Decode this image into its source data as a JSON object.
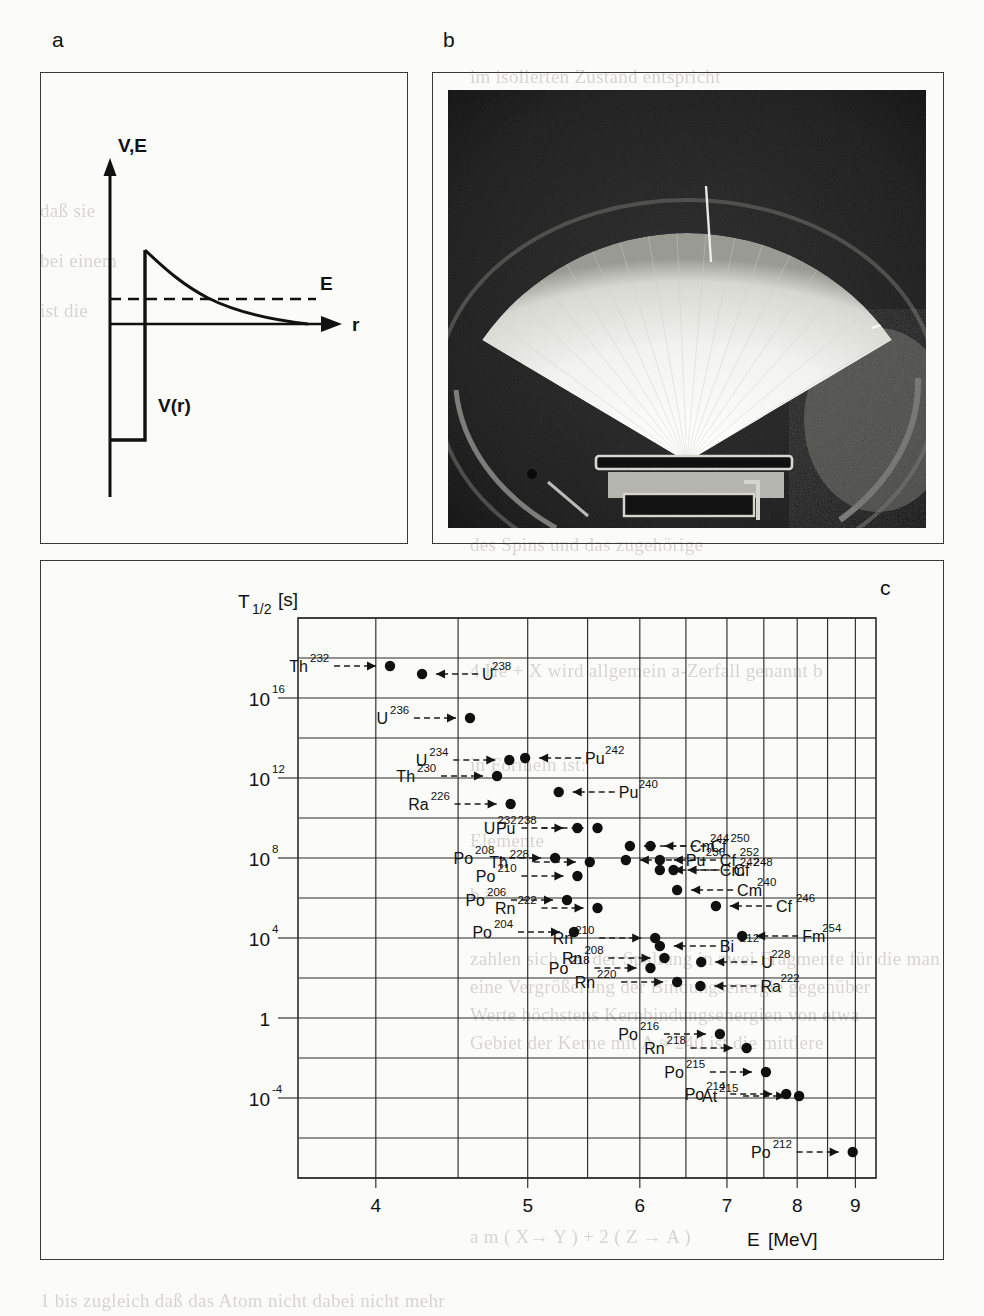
{
  "figure": {
    "panels": [
      {
        "id": "a",
        "letter": "a",
        "kind": "potential-barrier-diagram"
      },
      {
        "id": "b",
        "letter": "b",
        "kind": "cloud-chamber-photograph"
      },
      {
        "id": "c",
        "letter": "c",
        "kind": "geiger-nuttall-plot"
      }
    ]
  },
  "panel_a": {
    "letter": "a",
    "y_axis_label": "V,E",
    "x_axis_label": "r",
    "energy_level_label": "E",
    "potential_label": "V(r)"
  },
  "panel_b": {
    "letter": "b",
    "description": "cloud chamber photograph of alpha particle tracks forming a fan"
  },
  "panel_c": {
    "letter": "c"
  },
  "chart_data": {
    "type": "scatter",
    "title": "",
    "xlabel": "E  [MeV]",
    "ylabel": "T1/2  [s]",
    "ylabel_base": "T",
    "ylabel_sub": "1/2",
    "ylabel_unit": "[s]",
    "xlabel_sym": "E",
    "xlabel_unit": "[MeV]",
    "x_scale": "1/sqrt(E)",
    "y_scale": "log10",
    "xlim": [
      3.6,
      9.4
    ],
    "ylim_log": [
      -8,
      20
    ],
    "grid": true,
    "legend": "none",
    "xticks": [
      "4",
      "5",
      "6",
      "7",
      "8",
      "9"
    ],
    "xtick_values": [
      4,
      5,
      6,
      7,
      8,
      9
    ],
    "yticks": [
      "10¹⁶",
      "10¹²",
      "10⁸",
      "10⁴",
      "1",
      "10⁻⁴"
    ],
    "ytick_exponents": [
      16,
      12,
      8,
      4,
      0,
      -4
    ],
    "ytick_base": [
      "10",
      "10",
      "10",
      "10",
      "1",
      "10"
    ],
    "ytick_sup": [
      "16",
      "12",
      "8",
      "4",
      "",
      "-4"
    ],
    "points": [
      {
        "el": "Th",
        "a": "232",
        "E": 4.08,
        "logT": 17.6,
        "label_side": "left"
      },
      {
        "el": "U",
        "a": "238",
        "E": 4.27,
        "logT": 17.2,
        "label_side": "right"
      },
      {
        "el": "U",
        "a": "236",
        "E": 4.58,
        "logT": 15.0,
        "label_side": "left"
      },
      {
        "el": "U",
        "a": "234",
        "E": 4.86,
        "logT": 12.9,
        "label_side": "left"
      },
      {
        "el": "Pu",
        "a": "242",
        "E": 4.98,
        "logT": 13.0,
        "label_side": "right"
      },
      {
        "el": "Th",
        "a": "230",
        "E": 4.77,
        "logT": 12.1,
        "label_side": "left"
      },
      {
        "el": "Ra",
        "a": "226",
        "E": 4.87,
        "logT": 10.7,
        "label_side": "left"
      },
      {
        "el": "Pu",
        "a": "240",
        "E": 5.25,
        "logT": 11.3,
        "label_side": "right"
      },
      {
        "el": "U",
        "a": "232",
        "E": 5.41,
        "logT": 9.5,
        "label_side": "left"
      },
      {
        "el": "Pu",
        "a": "238",
        "E": 5.59,
        "logT": 9.5,
        "label_side": "left"
      },
      {
        "el": "Cf",
        "a": "252",
        "E": 6.21,
        "logT": 7.9,
        "label_side": "right"
      },
      {
        "el": "Cm",
        "a": "244",
        "E": 5.9,
        "logT": 8.6,
        "label_side": "right"
      },
      {
        "el": "Cf",
        "a": "250",
        "E": 6.11,
        "logT": 8.6,
        "label_side": "right"
      },
      {
        "el": "Cm",
        "a": "242",
        "E": 6.21,
        "logT": 7.4,
        "label_side": "right"
      },
      {
        "el": "Cf",
        "a": "248",
        "E": 6.36,
        "logT": 7.4,
        "label_side": "right"
      },
      {
        "el": "Po",
        "a": "208",
        "E": 5.22,
        "logT": 8.0,
        "label_side": "left"
      },
      {
        "el": "Po",
        "a": "210",
        "E": 5.41,
        "logT": 7.1,
        "label_side": "left"
      },
      {
        "el": "Th",
        "a": "228",
        "E": 5.52,
        "logT": 7.8,
        "label_side": "left"
      },
      {
        "el": "Pu",
        "a": "236",
        "E": 5.86,
        "logT": 7.9,
        "label_side": "right"
      },
      {
        "el": "Cm",
        "a": "240",
        "E": 6.4,
        "logT": 6.4,
        "label_side": "right"
      },
      {
        "el": "Po",
        "a": "206",
        "E": 5.32,
        "logT": 5.9,
        "label_side": "left"
      },
      {
        "el": "Rn",
        "a": "222",
        "E": 5.59,
        "logT": 5.5,
        "label_side": "left"
      },
      {
        "el": "Cf",
        "a": "246",
        "E": 6.86,
        "logT": 5.6,
        "label_side": "right"
      },
      {
        "el": "Po",
        "a": "204",
        "E": 5.38,
        "logT": 4.3,
        "label_side": "left"
      },
      {
        "el": "Rn",
        "a": "210",
        "E": 6.16,
        "logT": 4.0,
        "label_side": "left"
      },
      {
        "el": "Bi",
        "a": "212",
        "E": 6.21,
        "logT": 3.6,
        "label_side": "right"
      },
      {
        "el": "Fm",
        "a": "254",
        "E": 7.2,
        "logT": 4.1,
        "label_side": "right"
      },
      {
        "el": "Po",
        "a": "218",
        "E": 6.11,
        "logT": 2.5,
        "label_side": "left"
      },
      {
        "el": "Rn",
        "a": "208",
        "E": 6.26,
        "logT": 3.0,
        "label_side": "left"
      },
      {
        "el": "U",
        "a": "228",
        "E": 6.68,
        "logT": 2.8,
        "label_side": "right"
      },
      {
        "el": "Rn",
        "a": "220",
        "E": 6.4,
        "logT": 1.8,
        "label_side": "left"
      },
      {
        "el": "Ra",
        "a": "222",
        "E": 6.67,
        "logT": 1.6,
        "label_side": "right"
      },
      {
        "el": "Po",
        "a": "216",
        "E": 6.91,
        "logT": -0.8,
        "label_side": "left"
      },
      {
        "el": "Rn",
        "a": "218",
        "E": 7.26,
        "logT": -1.5,
        "label_side": "left"
      },
      {
        "el": "Po",
        "a": "215",
        "E": 7.53,
        "logT": -2.7,
        "label_side": "left"
      },
      {
        "el": "Po",
        "a": "214",
        "E": 7.83,
        "logT": -3.8,
        "label_side": "left"
      },
      {
        "el": "At",
        "a": "215",
        "E": 8.03,
        "logT": -3.9,
        "label_side": "left"
      },
      {
        "el": "Po",
        "a": "212",
        "E": 8.95,
        "logT": -6.7,
        "label_side": "left"
      }
    ]
  },
  "bleed_text": {
    "lines": [
      {
        "t": "im isolierten Zustand entspricht",
        "x": 470,
        "y": 66,
        "s": 19
      },
      {
        "t": "kann, bzw. die dadurch freige-",
        "x": 470,
        "y": 94,
        "s": 19
      },
      {
        "t": "einen kurzen Abriß der histori-",
        "x": 470,
        "y": 122,
        "s": 19
      },
      {
        "t": "n Reaktionen. Bei allen Strah-",
        "x": 470,
        "y": 150,
        "s": 19
      },
      {
        "t": "ten eines Teilchens aus dem",
        "x": 470,
        "y": 178,
        "s": 19
      },
      {
        "t": "die Nukleonen, doch ist der nächt-",
        "x": 470,
        "y": 206,
        "s": 19
      },
      {
        "t": "unterschiedliche Vorgänge, bei",
        "x": 470,
        "y": 234,
        "s": 19
      },
      {
        "t": "2.2 Spontane Spaltung schwerer Elemente",
        "x": 470,
        "y": 362,
        "s": 21
      },
      {
        "t": "Kernspaltung",
        "x": 470,
        "y": 438,
        "s": 19
      },
      {
        "t": "Kerne durch eine Potentialbarriere ums und ein Spin",
        "x": 470,
        "y": 506,
        "s": 19
      },
      {
        "t": "des Spins und das zugehörige",
        "x": 470,
        "y": 534,
        "s": 19
      },
      {
        "t": "4 He + X  wird allgemein a-Zerfall genannt  b",
        "x": 470,
        "y": 660,
        "s": 19
      },
      {
        "t": "in Formeln ist:",
        "x": 470,
        "y": 754,
        "s": 19
      },
      {
        "t": "Elemente",
        "x": 470,
        "y": 830,
        "s": 19
      },
      {
        "t": "b  =",
        "x": 470,
        "y": 884,
        "s": 19
      },
      {
        "t": "zahlen sich bei der Spaltung in zwei Fragmente für die man",
        "x": 470,
        "y": 948,
        "s": 19
      },
      {
        "t": "eine Vergrößerung der Bindungsenergie gegenüber",
        "x": 470,
        "y": 976,
        "s": 19
      },
      {
        "t": "Werte höchstens Kernbindungsenergien von etwa",
        "x": 470,
        "y": 1004,
        "s": 19
      },
      {
        "t": "Gebiet der Kerne mit A ≈ 240 ist die mittlere",
        "x": 470,
        "y": 1032,
        "s": 19
      },
      {
        "t": "a m  ( X→ Y ) + 2 ( Z → A )",
        "x": 470,
        "y": 1226,
        "s": 19
      },
      {
        "t": "1  bis  zugleich daß das Atom nicht dabei nicht mehr",
        "x": 40,
        "y": 1290,
        "s": 19
      },
      {
        "t": "daß sie",
        "x": 40,
        "y": 200,
        "s": 19
      },
      {
        "t": "bei einem",
        "x": 40,
        "y": 250,
        "s": 19
      },
      {
        "t": "ist die",
        "x": 40,
        "y": 300,
        "s": 19
      }
    ]
  }
}
